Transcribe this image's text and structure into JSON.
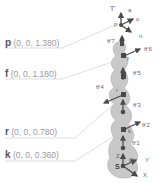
{
  "points": [
    {
      "id": "p",
      "name": "p",
      "coords": "(0, 0, 1.380)",
      "x": 5,
      "y": 38
    },
    {
      "id": "f",
      "name": "f",
      "coords": "(0, 0, 1.180)",
      "x": 5,
      "y": 69
    },
    {
      "id": "r",
      "name": "r",
      "coords": "(0, 0, 0.780)",
      "x": 5,
      "y": 127
    },
    {
      "id": "k",
      "name": "k",
      "coords": "(0, 0, 0.360)",
      "x": 5,
      "y": 150
    }
  ],
  "frames": {
    "tool": {
      "label": "T'",
      "axes": [
        "a",
        "o",
        "n"
      ],
      "origin": "p"
    },
    "base": {
      "label": "S",
      "axes": [
        "Z",
        "Y",
        "X"
      ],
      "origin_marker": "O"
    }
  },
  "joints": [
    "θ'7",
    "θ'6",
    "θ'5",
    "θ'4",
    "θ'3",
    "θ'2",
    "θ'1"
  ],
  "joint_labels": {
    "j7": "θ'7",
    "j6": "θ'6",
    "j5": "θ'5",
    "j4": "θ'4",
    "j3": "θ'3",
    "j2": "θ'2",
    "j1": "θ'1"
  },
  "link_labels": {
    "f": "f",
    "r": "r",
    "k": "k",
    "p": "p"
  },
  "axis_labels": {
    "a": "a",
    "o": "o",
    "n": "n",
    "T": "T'",
    "Z": "Z",
    "Y": "Y",
    "X": "X",
    "S": "S",
    "O": "O"
  },
  "colors": {
    "body": "#c8c8c8",
    "body_edge": "#a8a8a8",
    "arrow": "#4a4a4a",
    "leader": "#cfcfcf",
    "text": "#9a9a9a",
    "bold": "#555555"
  }
}
